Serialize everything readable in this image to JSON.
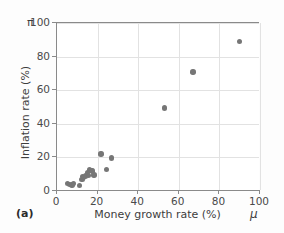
{
  "figure": {
    "panel_label": "(a)",
    "marker_color": "#767676",
    "axis_color": "#8a8a8a",
    "grid_color": "#e2e2e2",
    "text_color": "#3d3d3d"
  },
  "chart_data": {
    "type": "scatter",
    "title": "",
    "xlabel": "Money growth rate (%)",
    "ylabel": "Inflation rate (%)",
    "x_symbol": "μ",
    "y_symbol": "π",
    "xlim": [
      0,
      100
    ],
    "ylim": [
      0,
      100
    ],
    "xticks": [
      0,
      20,
      40,
      60,
      80,
      100
    ],
    "yticks": [
      0,
      20,
      40,
      60,
      80,
      100
    ],
    "xticklabels": [
      "0",
      "20",
      "40",
      "60",
      "80",
      "100"
    ],
    "yticklabels": [
      "0",
      "20",
      "40",
      "60",
      "80",
      "100"
    ],
    "grid": true,
    "legend": null,
    "series": [
      {
        "name": "countries",
        "points": [
          [
            5.2,
            4.6
          ],
          [
            6.3,
            3.9
          ],
          [
            7.4,
            3.6
          ],
          [
            8.0,
            4.4
          ],
          [
            11.2,
            3.4
          ],
          [
            12.3,
            6.8
          ],
          [
            12.6,
            8.6
          ],
          [
            13.2,
            8.0
          ],
          [
            14.0,
            9.0
          ],
          [
            15.0,
            11.0
          ],
          [
            15.6,
            9.4
          ],
          [
            16.1,
            12.6
          ],
          [
            16.8,
            12.2
          ],
          [
            17.6,
            12.0
          ],
          [
            18.2,
            9.6
          ],
          [
            21.6,
            22.0
          ],
          [
            24.4,
            12.8
          ],
          [
            26.8,
            19.6
          ],
          [
            53.0,
            49.4
          ],
          [
            67.0,
            70.8
          ],
          [
            90.0,
            89.0
          ]
        ]
      }
    ]
  }
}
